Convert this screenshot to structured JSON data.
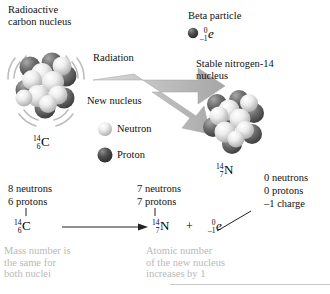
{
  "figure": {
    "type": "diagram",
    "background": "#ffffff"
  },
  "labels": {
    "radioactive_nucleus": "Radioactive\ncarbon nucleus",
    "radiation": "Radiation",
    "new_nucleus": "New nucleus",
    "beta_particle": "Beta particle",
    "stable_nucleus": "Stable nitrogen-14\nnucleus",
    "neutron_legend": "Neutron",
    "proton_legend": "Proton"
  },
  "symbols": {
    "carbon": {
      "mass": "14",
      "atomic": "6",
      "element": "C"
    },
    "nitrogen": {
      "mass": "14",
      "atomic": "7",
      "element": "N"
    },
    "electron_top": {
      "mass": "0",
      "charge": "–1",
      "element": "e"
    },
    "electron_eq": {
      "mass": "0",
      "charge": "–1",
      "element": "e"
    },
    "plus": "+"
  },
  "composition": {
    "left": {
      "neutrons": "8 neutrons",
      "protons": "6 protons"
    },
    "right": {
      "neutrons": "7 neutrons",
      "protons": "7 protons"
    },
    "electron": {
      "neutrons": "0 neutrons",
      "protons": "0 protons",
      "charge": "–1 charge"
    }
  },
  "captions": {
    "mass_number": "Mass number is\nthe same for\nboth nuclei",
    "atomic_number": "Atomic number\nof the new nucleus\nincreases by 1"
  },
  "colors": {
    "text": "#111111",
    "caption_text": "#b9b9b9",
    "arrow": "#b3b3b3",
    "arrow_edge": "#9a9a9a",
    "neutron": "#e8e8e8",
    "proton": "#5a5a5a",
    "rule": "#c9c9c9"
  }
}
